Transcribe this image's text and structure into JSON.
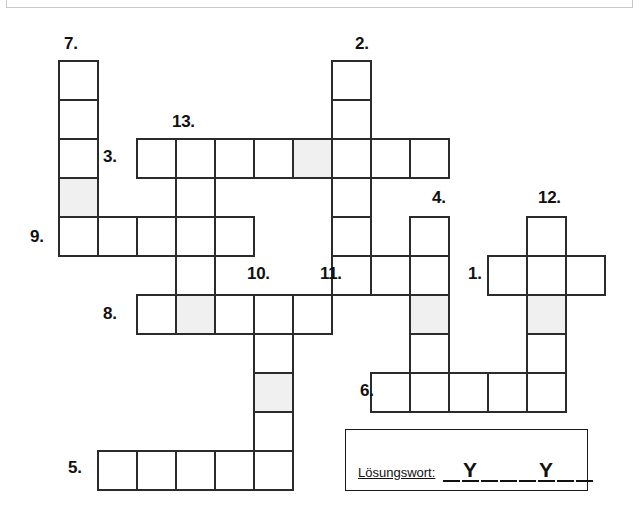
{
  "page": {
    "background": "#ffffff",
    "grid_line_color": "#2b2b2b",
    "shaded_cell_color": "#f0f0f0",
    "cell_size": 39
  },
  "top_strip": {
    "name": "top-cropped-panel",
    "visible": true
  },
  "crossword": {
    "cell_size": 39,
    "origin_x": 58,
    "origin_y": 60,
    "clue_numbers": [
      {
        "label": "7.",
        "x": 64,
        "y": 35
      },
      {
        "label": "2.",
        "x": 355,
        "y": 35
      },
      {
        "label": "13.",
        "x": 172,
        "y": 113
      },
      {
        "label": "3.",
        "x": 103,
        "y": 148
      },
      {
        "label": "4.",
        "x": 432,
        "y": 189
      },
      {
        "label": "12.",
        "x": 538,
        "y": 189
      },
      {
        "label": "9.",
        "x": 30,
        "y": 228
      },
      {
        "label": "10.",
        "x": 247,
        "y": 265
      },
      {
        "label": "11.",
        "x": 320,
        "y": 265
      },
      {
        "label": "1.",
        "x": 468,
        "y": 265
      },
      {
        "label": "8.",
        "x": 103,
        "y": 305
      },
      {
        "label": "6.",
        "x": 360,
        "y": 382
      },
      {
        "label": "5.",
        "x": 68,
        "y": 459
      }
    ],
    "entries": [
      {
        "number": "7.",
        "direction": "down",
        "col": 0,
        "row": 0,
        "length": 5,
        "shaded_index": 3
      },
      {
        "number": "2.",
        "direction": "down",
        "col": 7,
        "row": 0,
        "length": 6,
        "shaded_index": null
      },
      {
        "number": "3.",
        "direction": "across",
        "col": 2,
        "row": 2,
        "length": 8,
        "shaded_index": 4
      },
      {
        "number": "13.",
        "direction": "down",
        "col": 3,
        "row": 2,
        "length": 5,
        "shaded_index": null
      },
      {
        "number": "9.",
        "direction": "across",
        "col": 0,
        "row": 4,
        "length": 5,
        "shaded_index": null
      },
      {
        "number": "4.",
        "direction": "down",
        "col": 9,
        "row": 4,
        "length": 4,
        "shaded_index": 2
      },
      {
        "number": "12.",
        "direction": "down",
        "col": 12,
        "row": 4,
        "length": 5,
        "shaded_index": 2
      },
      {
        "number": "11.",
        "direction": "across",
        "col": 7,
        "row": 5,
        "length": 3,
        "shaded_index": null
      },
      {
        "number": "1.",
        "direction": "across",
        "col": 11,
        "row": 5,
        "length": 3,
        "shaded_index": null
      },
      {
        "number": "8.",
        "direction": "across",
        "col": 2,
        "row": 6,
        "length": 5,
        "shaded_index": 1
      },
      {
        "number": "10.",
        "direction": "down",
        "col": 5,
        "row": 6,
        "length": 5,
        "shaded_index": 2
      },
      {
        "number": "6.",
        "direction": "across",
        "col": 8,
        "row": 8,
        "length": 5,
        "shaded_index": null
      },
      {
        "number": "5.",
        "direction": "across",
        "col": 1,
        "row": 10,
        "length": 5,
        "shaded_index": null
      }
    ]
  },
  "solution": {
    "label": "Lösungswort:",
    "pattern": [
      "",
      "Y",
      "",
      "",
      "",
      "Y",
      "",
      ""
    ],
    "letters_shown": [
      "Y",
      "Y"
    ],
    "blank_count": 8
  }
}
